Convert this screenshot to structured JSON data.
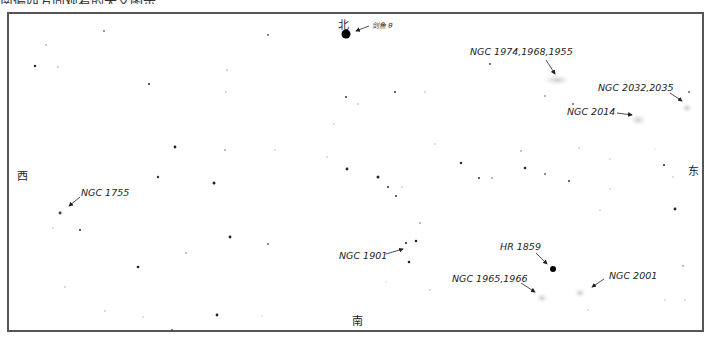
{
  "caption_clipped": "南偏西方向观看的天文图示",
  "directions": {
    "north": "北",
    "south": "南",
    "east": "东",
    "west": "西"
  },
  "labels": [
    {
      "id": "dorado-theta",
      "text": "剑鱼 θ"
    },
    {
      "id": "ngc-1974",
      "text": "NGC 1974,1968,1955"
    },
    {
      "id": "ngc-2032",
      "text": "NGC 2032,2035"
    },
    {
      "id": "ngc-2014",
      "text": "NGC 2014"
    },
    {
      "id": "ngc-1755",
      "text": "NGC 1755"
    },
    {
      "id": "ngc-1901",
      "text": "NGC 1901"
    },
    {
      "id": "hr-1859",
      "text": "HR 1859"
    },
    {
      "id": "ngc-1965",
      "text": "NGC 1965,1966"
    },
    {
      "id": "ngc-2001",
      "text": "NGC 2001"
    }
  ]
}
